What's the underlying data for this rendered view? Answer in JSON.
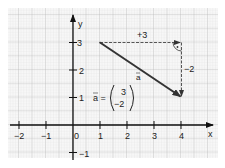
{
  "diagram": {
    "axes": {
      "x_label": "x",
      "y_label": "y",
      "x_ticks": [
        {
          "value": -2,
          "label": "−2"
        },
        {
          "value": -1,
          "label": "−1"
        },
        {
          "value": 0,
          "label": "0"
        },
        {
          "value": 1,
          "label": "1"
        },
        {
          "value": 2,
          "label": "2"
        },
        {
          "value": 3,
          "label": "3"
        },
        {
          "value": 4,
          "label": "4"
        }
      ],
      "y_ticks": [
        {
          "value": -1,
          "label": "−1"
        },
        {
          "value": 1,
          "label": "1"
        },
        {
          "value": 2,
          "label": "2"
        },
        {
          "value": 3,
          "label": "3"
        }
      ]
    },
    "vector": {
      "name": "a",
      "start": [
        1,
        3
      ],
      "end": [
        4,
        1
      ],
      "label": "a",
      "color": "#333333"
    },
    "components": {
      "horizontal_label": "+3",
      "vertical_label": "−2",
      "right_angle_marker": true
    },
    "formula": {
      "lhs": "a =",
      "top": "3",
      "bottom": "−2"
    },
    "colors": {
      "grid_fine": "#dcdcdc",
      "grid_major": "#b5b5b5",
      "axis": "#111111",
      "vector": "#333333"
    }
  }
}
